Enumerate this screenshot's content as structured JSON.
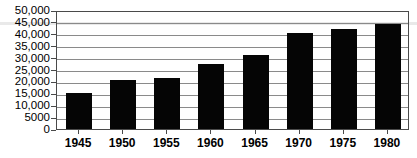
{
  "chart_data": {
    "type": "bar",
    "title": "",
    "subtitle": "",
    "xlabel": "",
    "ylabel": "",
    "categories": [
      "1945",
      "1950",
      "1955",
      "1960",
      "1965",
      "1970",
      "1975",
      "1980"
    ],
    "values": [
      15000,
      20700,
      21500,
      27500,
      31000,
      40200,
      42000,
      44000
    ],
    "series": [
      {
        "name": "",
        "values": [
          15000,
          20700,
          21500,
          27500,
          31000,
          40200,
          42000,
          44000
        ]
      }
    ],
    "ylim": [
      0,
      50000
    ],
    "ytick_values": [
      0,
      5000,
      10000,
      15000,
      20000,
      25000,
      30000,
      35000,
      40000,
      45000,
      50000
    ],
    "ytick_labels": [
      "0",
      "5000",
      "10,000",
      "15,000",
      "20,000",
      "25,000",
      "30,000",
      "35,000",
      "40,000",
      "45,000",
      "50,000"
    ],
    "xtick_labels": [
      "1945",
      "1950",
      "1955",
      "1960",
      "1965",
      "1970",
      "1975",
      "1980"
    ],
    "grid": true,
    "grid_axis": "y",
    "legend": false,
    "legend_position": "none",
    "bar_color": "#050505",
    "gridline_color": "#8a8a8a",
    "frame_color": "#4a4a4a",
    "background_color": "#ffffff",
    "annotations": []
  }
}
